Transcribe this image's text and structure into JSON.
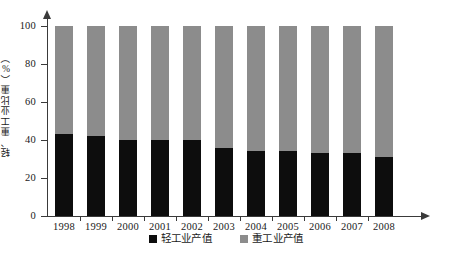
{
  "chart_data": {
    "type": "bar",
    "subtype": "stacked-percent",
    "title": "",
    "subtitle": "",
    "xlabel": "",
    "ylabel": "轻、重工业比重（%）",
    "categories": [
      "1998",
      "1999",
      "2000",
      "2001",
      "2002",
      "2003",
      "2004",
      "2005",
      "2006",
      "2007",
      "2008"
    ],
    "series": [
      {
        "name": "轻工业产值",
        "color": "#0d0d0d",
        "values": [
          43,
          42,
          40,
          40,
          40,
          36,
          34,
          34,
          33,
          33,
          31
        ]
      },
      {
        "name": "重工业产值",
        "color": "#8c8c8c",
        "values": [
          57,
          58,
          60,
          60,
          60,
          64,
          66,
          66,
          67,
          67,
          69
        ]
      }
    ],
    "ylim": [
      0,
      100
    ],
    "yticks": [
      0,
      20,
      40,
      60,
      80,
      100
    ],
    "ytick_labels": [
      "0",
      "20",
      "40",
      "60",
      "80",
      "100"
    ],
    "grid": false,
    "legend_position": "bottom",
    "annotations": []
  },
  "axes": {
    "y_title": "轻、重工业比重（%）",
    "y_tick_labels": [
      "100",
      "80",
      "60",
      "40",
      "20",
      "0"
    ],
    "x_tick_labels": [
      "1998",
      "1999",
      "2000",
      "2001",
      "2002",
      "2003",
      "2004",
      "2005",
      "2006",
      "2007",
      "2008"
    ]
  },
  "legend": {
    "items": [
      {
        "label": "轻工业产值",
        "color": "#0d0d0d"
      },
      {
        "label": "重工业产值",
        "color": "#8c8c8c"
      }
    ]
  },
  "colors": {
    "light_industry": "#0d0d0d",
    "heavy_industry": "#8c8c8c",
    "axis": "#3a3a3a",
    "background": "#ffffff"
  }
}
